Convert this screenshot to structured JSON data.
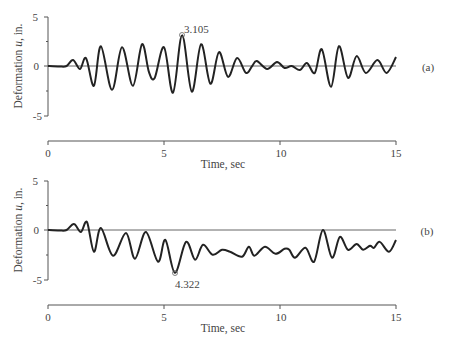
{
  "chart_data": [
    {
      "type": "line",
      "panel_label": "(a)",
      "title": "",
      "xlabel": "Time, sec",
      "ylabel": "Deformation u, in.",
      "xlim": [
        0,
        15
      ],
      "ylim": [
        -5,
        5
      ],
      "xticks": [
        "0",
        "5",
        "10",
        "15"
      ],
      "yticks": [
        "5",
        "0",
        "-5"
      ],
      "grid": false,
      "annotation": {
        "label": "3.105",
        "x": 5.78,
        "y": 3.105
      },
      "series": [
        {
          "name": "u(t)",
          "x": [
            0,
            0.5,
            0.8,
            1.08,
            1.38,
            1.64,
            1.98,
            2.28,
            2.76,
            3.19,
            3.66,
            4.05,
            4.35,
            4.6,
            5.0,
            5.39,
            5.78,
            6.2,
            6.6,
            7.0,
            7.37,
            7.76,
            8.15,
            8.53,
            8.8,
            9.0,
            9.45,
            9.87,
            10.2,
            10.5,
            10.86,
            11.16,
            11.5,
            11.8,
            12.2,
            12.54,
            12.93,
            13.3,
            13.7,
            14.2,
            14.6,
            15.0
          ],
          "y": [
            0,
            -0.05,
            0,
            0.6,
            -0.3,
            0.8,
            -2.0,
            2.0,
            -2.4,
            1.9,
            -2.0,
            2.2,
            -0.6,
            -1.2,
            1.9,
            -2.7,
            3.105,
            -2.6,
            2.2,
            -1.8,
            1.4,
            -1.1,
            0.8,
            -0.7,
            0.0,
            0.5,
            -0.3,
            0.4,
            -0.2,
            0.0,
            -0.4,
            0.3,
            -0.7,
            1.7,
            -2.1,
            2.0,
            -1.2,
            1.0,
            -0.7,
            0.6,
            -0.7,
            0.9
          ]
        }
      ]
    },
    {
      "type": "line",
      "panel_label": "(b)",
      "title": "",
      "xlabel": "Time, sec",
      "ylabel": "Deformation u, in.",
      "xlim": [
        0,
        15
      ],
      "ylim": [
        -5,
        5
      ],
      "xticks": [
        "0",
        "5",
        "10",
        "15"
      ],
      "yticks": [
        "5",
        "0",
        "-5"
      ],
      "grid": false,
      "annotation": {
        "label": "4.322",
        "x": 5.47,
        "y": -4.322
      },
      "series": [
        {
          "name": "u(t)",
          "x": [
            0,
            0.5,
            0.8,
            1.12,
            1.42,
            1.68,
            1.98,
            2.28,
            2.8,
            3.36,
            3.75,
            4.22,
            4.74,
            5.06,
            5.47,
            5.95,
            6.34,
            6.68,
            7.1,
            7.5,
            7.85,
            8.36,
            8.66,
            8.9,
            9.35,
            9.8,
            10.2,
            10.4,
            10.65,
            11.1,
            11.47,
            11.85,
            12.24,
            12.58,
            12.93,
            13.3,
            13.58,
            13.88,
            14.05,
            14.3,
            14.7,
            15.0
          ],
          "y": [
            0,
            -0.05,
            0,
            0.6,
            -0.2,
            0.8,
            -2.2,
            0.2,
            -2.6,
            -0.3,
            -2.9,
            -0.2,
            -3.2,
            -1.0,
            -4.322,
            -1.2,
            -3.0,
            -1.5,
            -2.5,
            -2.0,
            -2.2,
            -2.7,
            -1.7,
            -2.6,
            -1.7,
            -2.4,
            -1.9,
            -2.0,
            -2.8,
            -1.8,
            -3.2,
            0.0,
            -2.8,
            -0.7,
            -2.0,
            -1.4,
            -2.0,
            -1.6,
            -1.8,
            -1.2,
            -2.2,
            -1.0
          ]
        }
      ]
    }
  ],
  "labels": {
    "ylabel_prefix": "Deformation ",
    "ylabel_var": "u",
    "ylabel_suffix": ", in.",
    "xlabel": "Time, sec",
    "panel_a": "(a)",
    "panel_b": "(b)",
    "anno_a": "3.105",
    "anno_b": "4.322",
    "xtick_0": "0",
    "xtick_5": "5",
    "xtick_10": "10",
    "xtick_15": "15",
    "ytick_pos": "5",
    "ytick_zero": "0",
    "ytick_neg": "-5"
  }
}
